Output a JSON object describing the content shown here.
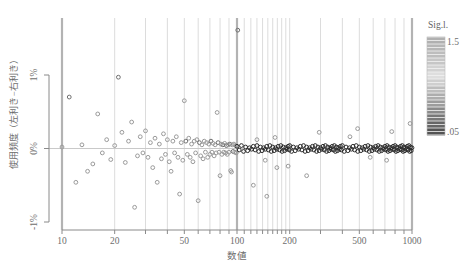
{
  "chart_data": {
    "type": "scatter",
    "title": "",
    "xlabel": "数値",
    "ylabel": "使用頻度（左利き−右利き）",
    "x_scale": "log",
    "xlim": [
      10,
      1000
    ],
    "ylim_percent": [
      -1.13,
      1.77
    ],
    "x_ticks_labeled": [
      {
        "value": 10,
        "label": "10"
      },
      {
        "value": 20,
        "label": "20"
      },
      {
        "value": 50,
        "label": "50"
      },
      {
        "value": 100,
        "label": "100"
      },
      {
        "value": 200,
        "label": "200"
      },
      {
        "value": 500,
        "label": "500"
      },
      {
        "value": 1000,
        "label": "1000"
      }
    ],
    "x_gridlines_major": [
      10,
      100,
      1000
    ],
    "x_gridlines_minor": [
      20,
      30,
      40,
      50,
      60,
      70,
      80,
      90,
      110,
      120,
      130,
      140,
      150,
      160,
      170,
      180,
      190,
      200,
      300,
      400,
      500,
      600,
      700,
      800,
      900
    ],
    "y_ticks": [
      {
        "value": 1,
        "label": "1%"
      },
      {
        "value": 0,
        "label": "0%"
      },
      {
        "value": -1,
        "label": "-1%"
      }
    ],
    "zero_line": 0,
    "legend": {
      "type": "colorbar",
      "title": "Sig.l.",
      "top_label": "1.5",
      "bottom_label": ".05",
      "stops": [
        "#b0b0b0",
        "#b6b6b6",
        "#bdbdbd",
        "#c6c6c6",
        "#d2d2d2",
        "#dedede",
        "#cfcfcf",
        "#bdbdbd",
        "#adadad",
        "#9c9c9c",
        "#8a8a8a",
        "#787878",
        "#666666",
        "#545454"
      ]
    },
    "colors": {
      "grid_minor": "#dcdcdc",
      "grid_major": "#b3b3b3",
      "axis": "#8a8a8a",
      "label": "#6e6e6e",
      "zero_line": "#c9c9c9",
      "point_light": "#9a9a9a",
      "point_mid": "#6f6f6f",
      "point_dark": "#2b2b2b"
    },
    "points": [
      [
        10,
        0.02,
        "l"
      ],
      [
        11,
        0.7,
        "m"
      ],
      [
        12,
        -0.46,
        "l"
      ],
      [
        13,
        0.05,
        "l"
      ],
      [
        14,
        -0.31,
        "l"
      ],
      [
        15,
        -0.21,
        "l"
      ],
      [
        16,
        0.47,
        "l"
      ],
      [
        17,
        -0.06,
        "l"
      ],
      [
        18,
        0.12,
        "l"
      ],
      [
        19,
        -0.15,
        "l"
      ],
      [
        20,
        0.04,
        "l"
      ],
      [
        21,
        0.97,
        "m"
      ],
      [
        22,
        0.22,
        "l"
      ],
      [
        23,
        -0.19,
        "l"
      ],
      [
        24,
        0.1,
        "l"
      ],
      [
        25,
        0.36,
        "l"
      ],
      [
        26,
        -0.8,
        "l"
      ],
      [
        27,
        -0.1,
        "l"
      ],
      [
        28,
        0.16,
        "l"
      ],
      [
        29,
        -0.06,
        "l"
      ],
      [
        30,
        0.24,
        "l"
      ],
      [
        31,
        -0.12,
        "l"
      ],
      [
        32,
        0.08,
        "l"
      ],
      [
        33,
        -0.26,
        "l"
      ],
      [
        34,
        0.14,
        "l"
      ],
      [
        35,
        -0.46,
        "l"
      ],
      [
        36,
        0.06,
        "l"
      ],
      [
        37,
        -0.14,
        "l"
      ],
      [
        38,
        0.2,
        "l"
      ],
      [
        39,
        -0.08,
        "l"
      ],
      [
        40,
        0.12,
        "l"
      ],
      [
        41,
        -0.18,
        "l"
      ],
      [
        42,
        -0.31,
        "l"
      ],
      [
        43,
        0.1,
        "l"
      ],
      [
        44,
        -0.06,
        "l"
      ],
      [
        45,
        0.16,
        "l"
      ],
      [
        46,
        -0.12,
        "l"
      ],
      [
        47,
        -0.62,
        "l"
      ],
      [
        48,
        0.08,
        "l"
      ],
      [
        49,
        -0.16,
        "l"
      ],
      [
        50,
        0.65,
        "l"
      ],
      [
        51,
        0.1,
        "m"
      ],
      [
        52,
        -0.08,
        "l"
      ],
      [
        53,
        0.14,
        "l"
      ],
      [
        54,
        -0.12,
        "l"
      ],
      [
        55,
        0.06,
        "l"
      ],
      [
        56,
        -0.18,
        "l"
      ],
      [
        57,
        0.1,
        "l"
      ],
      [
        58,
        -0.06,
        "l"
      ],
      [
        59,
        0.12,
        "l"
      ],
      [
        60,
        -0.71,
        "l"
      ],
      [
        61,
        0.08,
        "m"
      ],
      [
        62,
        -0.1,
        "l"
      ],
      [
        63,
        0.05,
        "l"
      ],
      [
        64,
        -0.14,
        "l"
      ],
      [
        65,
        0.1,
        "l"
      ],
      [
        66,
        -0.05,
        "l"
      ],
      [
        67,
        0.08,
        "l"
      ],
      [
        68,
        -0.12,
        "l"
      ],
      [
        69,
        0.06,
        "l"
      ],
      [
        70,
        -0.08,
        "l"
      ],
      [
        71,
        0.1,
        "m"
      ],
      [
        72,
        -0.05,
        "l"
      ],
      [
        73,
        0.07,
        "l"
      ],
      [
        74,
        -0.1,
        "l"
      ],
      [
        75,
        0.05,
        "l"
      ],
      [
        76,
        -0.06,
        "l"
      ],
      [
        77,
        0.49,
        "l"
      ],
      [
        78,
        0.08,
        "m"
      ],
      [
        79,
        -0.05,
        "l"
      ],
      [
        80,
        -0.37,
        "l"
      ],
      [
        81,
        0.06,
        "l"
      ],
      [
        82,
        -0.08,
        "l"
      ],
      [
        83,
        0.05,
        "m"
      ],
      [
        84,
        -0.05,
        "l"
      ],
      [
        85,
        0.07,
        "l"
      ],
      [
        86,
        -0.06,
        "l"
      ],
      [
        87,
        0.04,
        "m"
      ],
      [
        88,
        -0.08,
        "l"
      ],
      [
        89,
        0.05,
        "l"
      ],
      [
        90,
        -0.05,
        "l"
      ],
      [
        91,
        0.06,
        "m"
      ],
      [
        92,
        -0.3,
        "l"
      ],
      [
        93,
        -0.32,
        "l"
      ],
      [
        94,
        0.05,
        "l"
      ],
      [
        95,
        -0.04,
        "m"
      ],
      [
        96,
        0.06,
        "l"
      ],
      [
        97,
        -0.05,
        "l"
      ],
      [
        98,
        0.04,
        "l"
      ],
      [
        99,
        -0.06,
        "l"
      ],
      [
        101,
        1.61,
        "m"
      ],
      [
        124,
        -0.5,
        "l"
      ],
      [
        130,
        0.12,
        "l"
      ],
      [
        145,
        -0.16,
        "l"
      ],
      [
        148,
        -0.65,
        "l"
      ],
      [
        165,
        0.15,
        "l"
      ],
      [
        169,
        -0.26,
        "l"
      ],
      [
        196,
        -0.24,
        "l"
      ],
      [
        250,
        -0.37,
        "l"
      ],
      [
        295,
        0.22,
        "l"
      ],
      [
        442,
        0.16,
        "l"
      ],
      [
        489,
        0.27,
        "l"
      ],
      [
        577,
        -0.12,
        "l"
      ],
      [
        716,
        -0.16,
        "l"
      ],
      [
        766,
        0.23,
        "l"
      ],
      [
        975,
        0.34,
        "l"
      ],
      [
        100,
        0.03,
        "d"
      ],
      [
        103,
        -0.02,
        "d"
      ],
      [
        106,
        0.04,
        "d"
      ],
      [
        109,
        -0.04,
        "d"
      ],
      [
        112,
        0.02,
        "d"
      ],
      [
        115,
        -0.03,
        "d"
      ],
      [
        118,
        0.01,
        "d"
      ],
      [
        121,
        -0.01,
        "d"
      ],
      [
        124,
        0.03,
        "d"
      ],
      [
        127,
        -0.02,
        "d"
      ],
      [
        130,
        0.04,
        "d"
      ],
      [
        133,
        -0.04,
        "d"
      ],
      [
        136,
        0.02,
        "d"
      ],
      [
        139,
        -0.03,
        "d"
      ],
      [
        142,
        0.01,
        "d"
      ],
      [
        145,
        -0.01,
        "d"
      ],
      [
        148,
        0.03,
        "d"
      ],
      [
        151,
        -0.02,
        "d"
      ],
      [
        154,
        0.04,
        "d"
      ],
      [
        157,
        -0.04,
        "d"
      ],
      [
        160,
        0.02,
        "d"
      ],
      [
        163,
        -0.03,
        "d"
      ],
      [
        166,
        0.01,
        "d"
      ],
      [
        169,
        -0.01,
        "d"
      ],
      [
        172,
        0.03,
        "d"
      ],
      [
        175,
        -0.02,
        "d"
      ],
      [
        178,
        0.04,
        "d"
      ],
      [
        181,
        -0.04,
        "d"
      ],
      [
        184,
        0.02,
        "d"
      ],
      [
        187,
        -0.03,
        "d"
      ],
      [
        190,
        0.01,
        "d"
      ],
      [
        193,
        -0.01,
        "d"
      ],
      [
        196,
        0.03,
        "d"
      ],
      [
        199,
        -0.02,
        "d"
      ],
      [
        200,
        0.04,
        "d"
      ],
      [
        205,
        -0.04,
        "d"
      ],
      [
        210,
        0.02,
        "d"
      ],
      [
        215,
        -0.03,
        "d"
      ],
      [
        220,
        0.01,
        "d"
      ],
      [
        225,
        -0.01,
        "d"
      ],
      [
        230,
        0.03,
        "d"
      ],
      [
        235,
        -0.02,
        "d"
      ],
      [
        240,
        0.04,
        "d"
      ],
      [
        245,
        -0.04,
        "d"
      ],
      [
        250,
        0.02,
        "d"
      ],
      [
        255,
        -0.03,
        "d"
      ],
      [
        260,
        0.01,
        "d"
      ],
      [
        265,
        -0.01,
        "d"
      ],
      [
        270,
        0.03,
        "d"
      ],
      [
        275,
        -0.02,
        "d"
      ],
      [
        280,
        0.04,
        "d"
      ],
      [
        285,
        -0.04,
        "d"
      ],
      [
        290,
        0.02,
        "d"
      ],
      [
        295,
        -0.03,
        "d"
      ],
      [
        300,
        0.01,
        "d"
      ],
      [
        305,
        -0.01,
        "d"
      ],
      [
        310,
        0.03,
        "d"
      ],
      [
        315,
        -0.02,
        "d"
      ],
      [
        320,
        0.04,
        "d"
      ],
      [
        325,
        -0.04,
        "d"
      ],
      [
        330,
        0.02,
        "d"
      ],
      [
        335,
        -0.03,
        "d"
      ],
      [
        340,
        0.01,
        "d"
      ],
      [
        345,
        -0.01,
        "d"
      ],
      [
        350,
        0.03,
        "d"
      ],
      [
        355,
        -0.02,
        "d"
      ],
      [
        360,
        0.04,
        "d"
      ],
      [
        365,
        -0.04,
        "d"
      ],
      [
        370,
        0.02,
        "d"
      ],
      [
        375,
        -0.03,
        "d"
      ],
      [
        380,
        0.01,
        "d"
      ],
      [
        385,
        -0.01,
        "d"
      ],
      [
        390,
        0.03,
        "d"
      ],
      [
        395,
        -0.02,
        "d"
      ],
      [
        400,
        0.04,
        "d"
      ],
      [
        410,
        -0.04,
        "d"
      ],
      [
        420,
        0.02,
        "d"
      ],
      [
        430,
        -0.03,
        "d"
      ],
      [
        440,
        0.01,
        "d"
      ],
      [
        450,
        -0.01,
        "d"
      ],
      [
        460,
        0.03,
        "d"
      ],
      [
        470,
        -0.02,
        "d"
      ],
      [
        480,
        0.04,
        "d"
      ],
      [
        490,
        -0.04,
        "d"
      ],
      [
        500,
        0.02,
        "d"
      ],
      [
        510,
        -0.03,
        "d"
      ],
      [
        520,
        0.01,
        "d"
      ],
      [
        530,
        -0.01,
        "d"
      ],
      [
        540,
        0.03,
        "d"
      ],
      [
        550,
        -0.02,
        "d"
      ],
      [
        560,
        0.04,
        "d"
      ],
      [
        570,
        -0.04,
        "d"
      ],
      [
        580,
        0.02,
        "d"
      ],
      [
        590,
        -0.03,
        "d"
      ],
      [
        600,
        0.01,
        "d"
      ],
      [
        610,
        -0.01,
        "d"
      ],
      [
        620,
        0.03,
        "d"
      ],
      [
        630,
        -0.02,
        "d"
      ],
      [
        640,
        0.04,
        "d"
      ],
      [
        650,
        -0.04,
        "d"
      ],
      [
        660,
        0.02,
        "d"
      ],
      [
        670,
        -0.03,
        "d"
      ],
      [
        680,
        0.01,
        "d"
      ],
      [
        690,
        -0.01,
        "d"
      ],
      [
        700,
        0.03,
        "d"
      ],
      [
        710,
        -0.02,
        "d"
      ],
      [
        720,
        0.04,
        "d"
      ],
      [
        730,
        -0.04,
        "d"
      ],
      [
        740,
        0.02,
        "d"
      ],
      [
        750,
        -0.03,
        "d"
      ],
      [
        760,
        0.01,
        "d"
      ],
      [
        770,
        -0.01,
        "d"
      ],
      [
        780,
        0.03,
        "d"
      ],
      [
        790,
        -0.02,
        "d"
      ],
      [
        800,
        0.04,
        "d"
      ],
      [
        810,
        -0.04,
        "d"
      ],
      [
        820,
        0.02,
        "d"
      ],
      [
        830,
        -0.03,
        "d"
      ],
      [
        840,
        0.01,
        "d"
      ],
      [
        850,
        -0.01,
        "d"
      ],
      [
        860,
        0.03,
        "d"
      ],
      [
        870,
        -0.02,
        "d"
      ],
      [
        880,
        0.04,
        "d"
      ],
      [
        890,
        -0.04,
        "d"
      ],
      [
        900,
        0.02,
        "d"
      ],
      [
        910,
        -0.03,
        "d"
      ],
      [
        920,
        0.01,
        "d"
      ],
      [
        930,
        -0.01,
        "d"
      ],
      [
        940,
        0.03,
        "d"
      ],
      [
        950,
        -0.02,
        "d"
      ],
      [
        960,
        0.04,
        "d"
      ],
      [
        970,
        -0.04,
        "d"
      ],
      [
        980,
        0.02,
        "d"
      ],
      [
        990,
        -0.03,
        "d"
      ],
      [
        1000,
        0.01,
        "d"
      ]
    ]
  }
}
